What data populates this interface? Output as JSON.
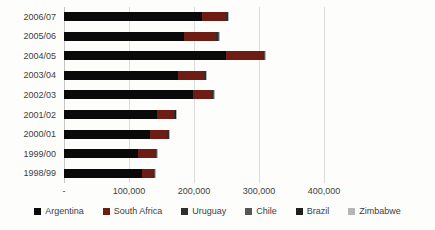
{
  "chart_data": {
    "type": "bar",
    "orientation": "horizontal",
    "stacked": true,
    "title": "",
    "xlabel": "",
    "ylabel": "",
    "categories": [
      "2006/07",
      "2005/06",
      "2004/05",
      "2003/04",
      "2002/03",
      "2001/02",
      "2000/01",
      "1999/00",
      "1998/99"
    ],
    "series": [
      {
        "name": "Argentina",
        "color": "#0a0a0a",
        "values": [
          212000,
          184000,
          249000,
          176000,
          199000,
          143000,
          132000,
          114000,
          120000
        ]
      },
      {
        "name": "South Africa",
        "color": "#6e1d15",
        "values": [
          38000,
          50000,
          57000,
          40000,
          29000,
          26000,
          27000,
          26000,
          17000
        ]
      },
      {
        "name": "Uruguay",
        "color": "#2f2f2f",
        "values": [
          2000,
          3000,
          2000,
          2000,
          2000,
          2000,
          2000,
          2000,
          2000
        ]
      },
      {
        "name": "Chile",
        "color": "#565656",
        "values": [
          500,
          1000,
          1000,
          500,
          500,
          500,
          500,
          500,
          500
        ]
      },
      {
        "name": "Brazil",
        "color": "#1f1f1f",
        "values": [
          500,
          500,
          500,
          500,
          500,
          300,
          300,
          300,
          300
        ]
      },
      {
        "name": "Zimbabwe",
        "color": "#b5b5b5",
        "values": [
          300,
          500,
          500,
          300,
          300,
          200,
          200,
          200,
          200
        ]
      }
    ],
    "x_axis": {
      "min": 0,
      "max": 400000,
      "tick_interval": 100000,
      "tick_labels": [
        "-",
        "100,000",
        "200,000",
        "300,000",
        "400,000"
      ]
    },
    "grid": true,
    "legend_position": "bottom",
    "colors": {
      "gridline": "#dcdcdc",
      "axis_text": "#404040",
      "background": "#fdfdfc"
    }
  }
}
